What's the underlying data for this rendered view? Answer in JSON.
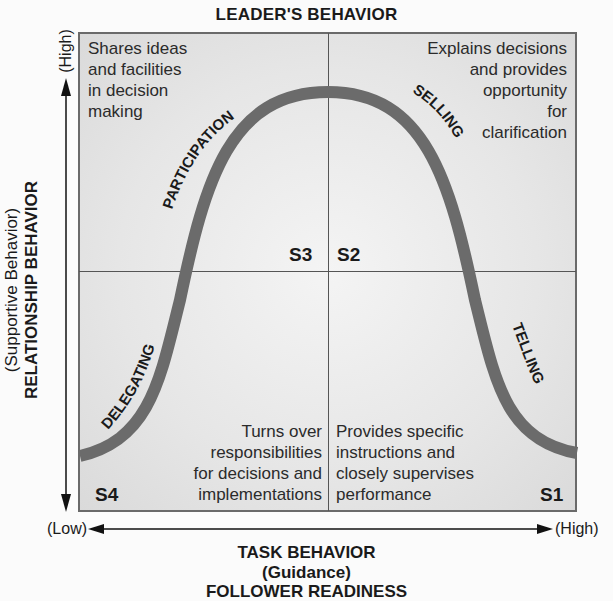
{
  "title": "LEADER'S BEHAVIOR",
  "y_axis": {
    "label_line1": "(Supportive Behavior)",
    "label_line2": "RELATIONSHIP BEHAVIOR",
    "high": "(High)"
  },
  "x_axis": {
    "low": "(Low)",
    "high": "(High)",
    "label_line1": "TASK BEHAVIOR",
    "label_line2": "(Guidance)",
    "label_line3": "FOLLOWER READINESS"
  },
  "quadrants": {
    "top_left": {
      "style": "S3",
      "curve_label": "PARTICIPATION",
      "lines": [
        "Shares ideas",
        "and facilities",
        "in decision",
        "making"
      ]
    },
    "top_right": {
      "style": "S2",
      "curve_label": "SELLING",
      "lines": [
        "Explains decisions",
        "and provides",
        "opportunity",
        "for",
        "clarification"
      ]
    },
    "bottom_left": {
      "style": "S4",
      "curve_label": "DELEGATING",
      "lines": [
        "Turns over",
        "responsibilities",
        "for decisions and",
        "implementations"
      ]
    },
    "bottom_right": {
      "style": "S1",
      "curve_label": "TELLING",
      "lines": [
        "Provides specific",
        "instructions and",
        "closely supervises",
        "performance"
      ]
    }
  },
  "colors": {
    "curve": "#6b6b6b",
    "box_border": "#6a6a6a",
    "text": "#1a1a1a"
  }
}
